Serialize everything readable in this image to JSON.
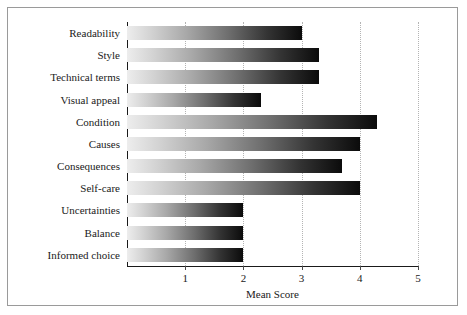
{
  "chart_data": {
    "type": "bar",
    "orientation": "horizontal",
    "title": "",
    "xlabel": "Mean Score",
    "ylabel": "",
    "xlim": [
      0,
      5
    ],
    "xticks": [
      "1",
      "2",
      "3",
      "4",
      "5"
    ],
    "grid": true,
    "legend": null,
    "categories": [
      "Readability",
      "Style",
      "Technical terms",
      "Visual appeal",
      "Condition",
      "Causes",
      "Consequences",
      "Self-care",
      "Uncertainties",
      "Balance",
      "Informed choice"
    ],
    "values": [
      3.0,
      3.3,
      3.3,
      2.3,
      4.3,
      4.0,
      3.7,
      4.0,
      2.0,
      2.0,
      2.0
    ],
    "bar_fill": "gradient light-gray to black",
    "colors": {
      "bar_gradient_start": "#ededed",
      "bar_gradient_end": "#0b0b0b",
      "axis": "#1a1a1a",
      "gridline": "#b4b4b4",
      "text": "#1a1a1a",
      "frame_border": "#9a9a9a",
      "background": "#ffffff"
    }
  }
}
